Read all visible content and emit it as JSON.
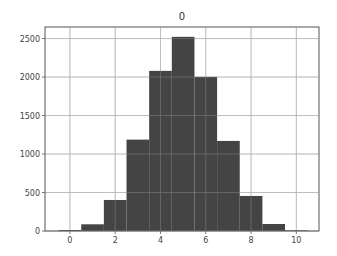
{
  "chart_data": {
    "type": "bar",
    "title": "0",
    "xlabel": "",
    "ylabel": "",
    "bin_edges": [
      -0.5,
      0.5,
      1.5,
      2.5,
      3.5,
      4.5,
      5.5,
      6.5,
      7.5,
      8.5,
      9.5,
      10.5
    ],
    "categories": [
      "0",
      "1",
      "2",
      "3",
      "4",
      "5",
      "6",
      "7",
      "8",
      "9",
      "10"
    ],
    "values": [
      13,
      87,
      403,
      1187,
      2080,
      2522,
      2002,
      1170,
      455,
      91,
      9
    ],
    "xlim": [
      -1.1,
      11.0
    ],
    "ylim": [
      0,
      2650
    ],
    "x_ticks": [
      0,
      2,
      4,
      6,
      8,
      10
    ],
    "x_tick_labels": [
      "0",
      "2",
      "4",
      "6",
      "8",
      "10"
    ],
    "y_ticks": [
      0,
      500,
      1000,
      1500,
      2000,
      2500
    ],
    "y_tick_labels": [
      "0",
      "500",
      "1000",
      "1500",
      "2000",
      "2500"
    ],
    "grid": true,
    "legend": null,
    "bar_color": "#444444",
    "grid_color": "#b0b0b0"
  }
}
